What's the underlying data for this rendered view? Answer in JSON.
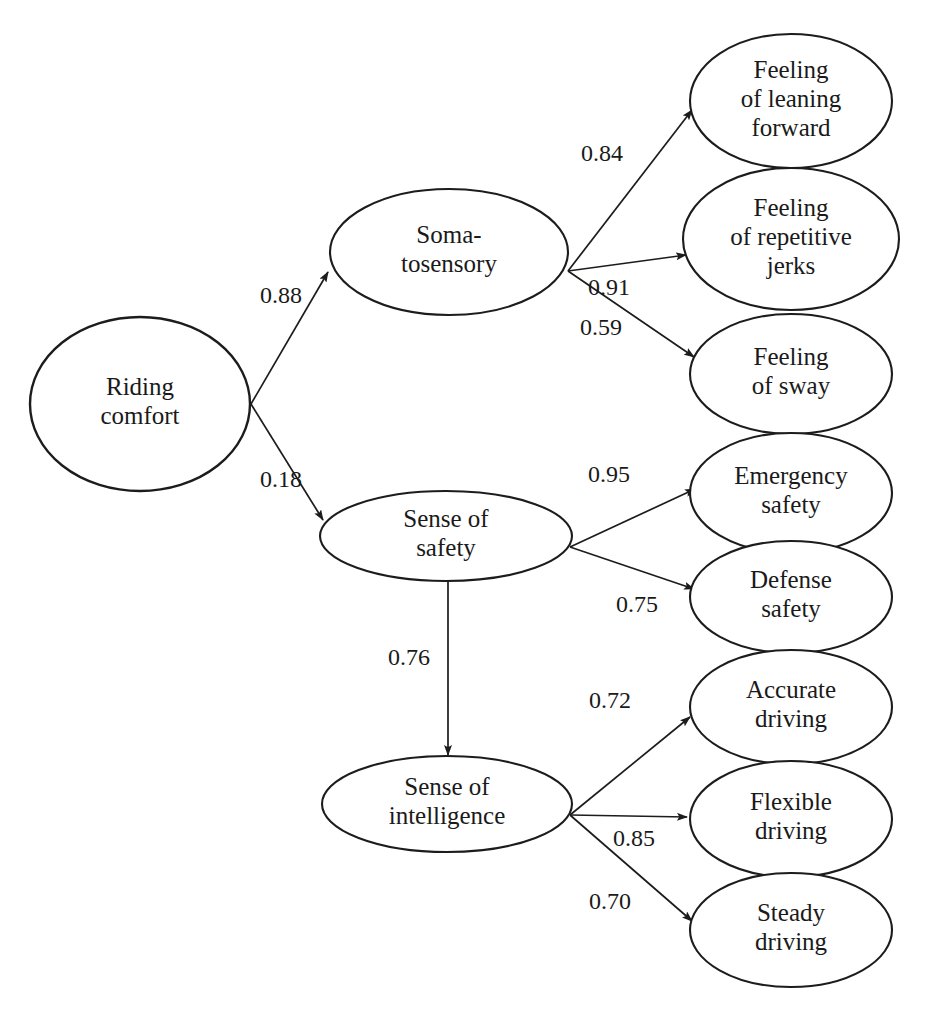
{
  "diagram": {
    "type": "sem-path-diagram",
    "background_color": "#ffffff",
    "stroke_color": "#1c1c1c",
    "text_color": "#1a1a1a"
  },
  "nodes": [
    {
      "id": "riding_comfort",
      "label": "Riding comfort",
      "lines": [
        "Riding",
        "comfort"
      ],
      "role": "exogenous-latent",
      "cx": 140,
      "cy": 404,
      "rx": 110,
      "ry": 87
    },
    {
      "id": "somatosensory",
      "label": "Soma-tosensory",
      "lines": [
        "Soma-",
        "tosensory"
      ],
      "role": "latent",
      "cx": 449,
      "cy": 252,
      "rx": 119,
      "ry": 63
    },
    {
      "id": "sense_of_safety",
      "label": "Sense of safety",
      "lines": [
        "Sense of",
        "safety"
      ],
      "role": "latent",
      "cx": 446,
      "cy": 536,
      "rx": 126,
      "ry": 45
    },
    {
      "id": "sense_of_intelligence",
      "label": "Sense of intelligence",
      "lines": [
        "Sense of",
        "intelligence"
      ],
      "role": "latent",
      "cx": 447,
      "cy": 804,
      "rx": 125,
      "ry": 48
    },
    {
      "id": "feeling_leaning_forward",
      "label": "Feeling of leaning forward",
      "lines": [
        "Feeling",
        "of leaning",
        "forward"
      ],
      "role": "indicator",
      "cx": 791,
      "cy": 101,
      "rx": 101,
      "ry": 67
    },
    {
      "id": "feeling_repetitive_jerks",
      "label": "Feeling of repetitive jerks",
      "lines": [
        "Feeling",
        "of repetitive",
        "jerks"
      ],
      "role": "indicator",
      "cx": 791,
      "cy": 239,
      "rx": 108,
      "ry": 71
    },
    {
      "id": "feeling_of_sway",
      "label": "Feeling of sway",
      "lines": [
        "Feeling",
        "of sway"
      ],
      "role": "indicator",
      "cx": 791,
      "cy": 374,
      "rx": 101,
      "ry": 60
    },
    {
      "id": "emergency_safety",
      "label": "Emergency safety",
      "lines": [
        "Emergency",
        "safety"
      ],
      "role": "indicator",
      "cx": 791,
      "cy": 493,
      "rx": 101,
      "ry": 60
    },
    {
      "id": "defense_safety",
      "label": "Defense safety",
      "lines": [
        "Defense",
        "safety"
      ],
      "role": "indicator",
      "cx": 791,
      "cy": 597,
      "rx": 101,
      "ry": 56
    },
    {
      "id": "accurate_driving",
      "label": "Accurate driving",
      "lines": [
        "Accurate",
        "driving"
      ],
      "role": "indicator",
      "cx": 791,
      "cy": 707,
      "rx": 101,
      "ry": 57
    },
    {
      "id": "flexible_driving",
      "label": "Flexible driving",
      "lines": [
        "Flexible",
        "driving"
      ],
      "role": "indicator",
      "cx": 791,
      "cy": 819,
      "rx": 101,
      "ry": 58
    },
    {
      "id": "steady_driving",
      "label": "Steady driving",
      "lines": [
        "Steady",
        "driving"
      ],
      "role": "indicator",
      "cx": 791,
      "cy": 930,
      "rx": 101,
      "ry": 57
    }
  ],
  "edges": [
    {
      "id": "rc_to_soma",
      "from": "riding_comfort",
      "to": "somatosensory",
      "coefficient": "0.88",
      "x1": 251,
      "y1": 404,
      "x2": 328,
      "y2": 272,
      "label_x": 281,
      "label_y": 297
    },
    {
      "id": "rc_to_safety",
      "from": "riding_comfort",
      "to": "sense_of_safety",
      "coefficient": "0.18",
      "x1": 251,
      "y1": 404,
      "x2": 323,
      "y2": 520,
      "label_x": 281,
      "label_y": 481
    },
    {
      "id": "soma_to_leaning",
      "from": "somatosensory",
      "to": "feeling_leaning_forward",
      "coefficient": "0.84",
      "x1": 568,
      "y1": 271,
      "x2": 692,
      "y2": 110,
      "label_x": 602,
      "label_y": 155
    },
    {
      "id": "soma_to_jerks",
      "from": "somatosensory",
      "to": "feeling_repetitive_jerks",
      "coefficient": "0.91",
      "x1": 568,
      "y1": 271,
      "x2": 686,
      "y2": 255,
      "label_x": 609,
      "label_y": 289
    },
    {
      "id": "soma_to_sway",
      "from": "somatosensory",
      "to": "feeling_of_sway",
      "coefficient": "0.59",
      "x1": 568,
      "y1": 271,
      "x2": 694,
      "y2": 357,
      "label_x": 601,
      "label_y": 329
    },
    {
      "id": "safety_to_emergency",
      "from": "sense_of_safety",
      "to": "emergency_safety",
      "coefficient": "0.95",
      "x1": 570,
      "y1": 547,
      "x2": 695,
      "y2": 489,
      "label_x": 609,
      "label_y": 476
    },
    {
      "id": "safety_to_defense",
      "from": "sense_of_safety",
      "to": "defense_safety",
      "coefficient": "0.75",
      "x1": 570,
      "y1": 547,
      "x2": 694,
      "y2": 589,
      "label_x": 637,
      "label_y": 606
    },
    {
      "id": "safety_to_intelligence",
      "from": "sense_of_safety",
      "to": "sense_of_intelligence",
      "coefficient": "0.76",
      "x1": 448,
      "y1": 581,
      "x2": 448,
      "y2": 755,
      "label_x": 409,
      "label_y": 659
    },
    {
      "id": "intel_to_accurate",
      "from": "sense_of_intelligence",
      "to": "accurate_driving",
      "coefficient": "0.72",
      "x1": 570,
      "y1": 815,
      "x2": 690,
      "y2": 717,
      "label_x": 610,
      "label_y": 702
    },
    {
      "id": "intel_to_flexible",
      "from": "sense_of_intelligence",
      "to": "flexible_driving",
      "coefficient": "0.85",
      "x1": 570,
      "y1": 815,
      "x2": 687,
      "y2": 817,
      "label_x": 634,
      "label_y": 840
    },
    {
      "id": "intel_to_steady",
      "from": "sense_of_intelligence",
      "to": "steady_driving",
      "coefficient": "0.70",
      "x1": 570,
      "y1": 815,
      "x2": 692,
      "y2": 921,
      "label_x": 610,
      "label_y": 903
    }
  ]
}
